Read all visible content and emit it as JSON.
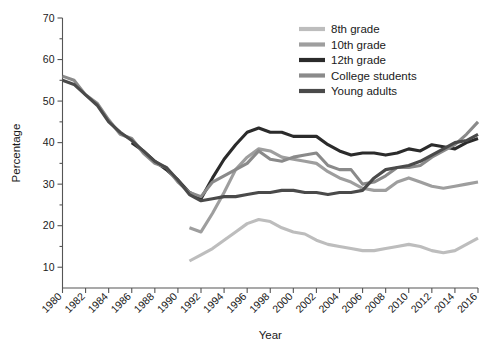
{
  "chart_data": {
    "type": "line",
    "title": "",
    "xlabel": "Year",
    "ylabel": "Percentage",
    "xlim": [
      1980,
      2016
    ],
    "ylim": [
      5,
      70
    ],
    "grid": false,
    "legend_position": "top-right",
    "x_ticks": [
      1980,
      1982,
      1984,
      1986,
      1988,
      1990,
      1992,
      1994,
      1996,
      1998,
      2000,
      2002,
      2004,
      2006,
      2008,
      2010,
      2012,
      2014,
      2016
    ],
    "y_ticks": [
      10,
      20,
      30,
      40,
      50,
      60,
      70
    ],
    "y_minor_ticks": [
      15,
      25,
      35,
      45,
      55,
      65
    ],
    "series": [
      {
        "name": "8th grade",
        "color": "#bdbdbd",
        "x": [
          1991,
          1992,
          1993,
          1994,
          1995,
          1996,
          1997,
          1998,
          1999,
          2000,
          2001,
          2002,
          2003,
          2004,
          2005,
          2006,
          2007,
          2008,
          2009,
          2010,
          2011,
          2012,
          2013,
          2014,
          2015,
          2016
        ],
        "values": [
          11.5,
          13.0,
          14.5,
          16.5,
          18.5,
          20.5,
          21.5,
          21.0,
          19.5,
          18.5,
          18.0,
          16.5,
          15.5,
          15.0,
          14.5,
          14.0,
          14.0,
          14.5,
          15.0,
          15.5,
          15.0,
          14.0,
          13.5,
          14.0,
          15.5,
          17.0
        ]
      },
      {
        "name": "10th grade",
        "color": "#9e9e9e",
        "x": [
          1991,
          1992,
          1993,
          1994,
          1995,
          1996,
          1997,
          1998,
          1999,
          2000,
          2001,
          2002,
          2003,
          2004,
          2005,
          2006,
          2007,
          2008,
          2009,
          2010,
          2011,
          2012,
          2013,
          2014,
          2015,
          2016
        ],
        "values": [
          19.5,
          18.5,
          23.0,
          28.0,
          33.5,
          36.5,
          38.5,
          38.0,
          36.5,
          36.0,
          35.5,
          35.0,
          33.0,
          31.5,
          30.5,
          29.0,
          28.5,
          28.5,
          30.5,
          31.5,
          30.5,
          29.5,
          29.0,
          29.5,
          30.0,
          30.5
        ]
      },
      {
        "name": "12th grade",
        "color": "#2b2b2b",
        "x": [
          1986,
          1987,
          1988,
          1989,
          1990,
          1991,
          1992,
          1993,
          1994,
          1995,
          1996,
          1997,
          1998,
          1999,
          2000,
          2001,
          2002,
          2003,
          2004,
          2005,
          2006,
          2007,
          2008,
          2009,
          2010,
          2011,
          2012,
          2013,
          2014,
          2015,
          2016
        ],
        "values": [
          40.0,
          38.0,
          35.5,
          33.5,
          31.0,
          28.0,
          26.5,
          31.5,
          36.0,
          39.5,
          42.5,
          43.5,
          42.5,
          42.5,
          41.5,
          41.5,
          41.5,
          39.5,
          38.0,
          37.0,
          37.5,
          37.5,
          37.0,
          37.5,
          38.5,
          38.0,
          39.5,
          39.0,
          38.5,
          40.0,
          41.0
        ]
      },
      {
        "name": "College students",
        "color": "#8a8a8a",
        "x": [
          1980,
          1981,
          1982,
          1983,
          1984,
          1985,
          1986,
          1987,
          1988,
          1989,
          1990,
          1991,
          1992,
          1993,
          1994,
          1995,
          1996,
          1997,
          1998,
          1999,
          2000,
          2001,
          2002,
          2003,
          2004,
          2005,
          2006,
          2007,
          2008,
          2009,
          2010,
          2011,
          2012,
          2013,
          2014,
          2015,
          2016
        ],
        "values": [
          56.0,
          55.0,
          51.5,
          49.5,
          45.5,
          42.0,
          41.0,
          37.5,
          35.0,
          34.0,
          30.5,
          28.0,
          27.0,
          30.5,
          32.0,
          33.5,
          35.0,
          38.0,
          36.0,
          35.5,
          36.5,
          37.0,
          37.5,
          34.5,
          33.5,
          33.5,
          30.0,
          30.5,
          32.0,
          34.0,
          34.0,
          34.5,
          36.5,
          38.0,
          39.5,
          42.0,
          45.0
        ]
      },
      {
        "name": "Young adults",
        "color": "#4a4a4a",
        "x": [
          1980,
          1981,
          1982,
          1983,
          1984,
          1985,
          1986,
          1987,
          1988,
          1989,
          1990,
          1991,
          1992,
          1993,
          1994,
          1995,
          1996,
          1997,
          1998,
          1999,
          2000,
          2001,
          2002,
          2003,
          2004,
          2005,
          2006,
          2007,
          2008,
          2009,
          2010,
          2011,
          2012,
          2013,
          2014,
          2015,
          2016
        ],
        "values": [
          55.0,
          54.0,
          51.5,
          49.0,
          45.0,
          42.5,
          40.5,
          38.0,
          35.5,
          34.0,
          31.0,
          27.5,
          26.0,
          26.5,
          27.0,
          27.0,
          27.5,
          28.0,
          28.0,
          28.5,
          28.5,
          28.0,
          28.0,
          27.5,
          28.0,
          28.0,
          28.5,
          31.5,
          33.5,
          34.0,
          34.5,
          35.5,
          37.0,
          38.5,
          40.0,
          40.5,
          42.0
        ]
      }
    ],
    "legend": [
      {
        "label": "8th grade",
        "color": "#bdbdbd"
      },
      {
        "label": "10th grade",
        "color": "#9e9e9e"
      },
      {
        "label": "12th grade",
        "color": "#2b2b2b"
      },
      {
        "label": "College students",
        "color": "#8a8a8a"
      },
      {
        "label": "Young adults",
        "color": "#4a4a4a"
      }
    ]
  }
}
